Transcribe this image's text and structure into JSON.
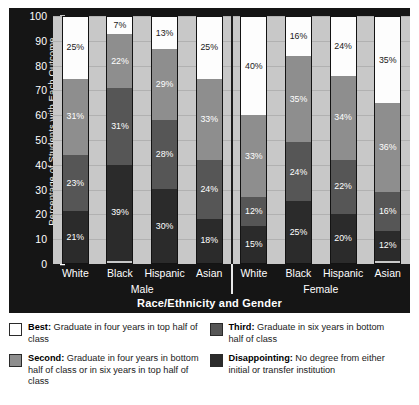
{
  "chart_data": {
    "type": "bar",
    "subtype": "stacked-bar-100",
    "title": "",
    "xlabel": "Race/Ethnicity and Gender",
    "ylabel": "Percentage of Students with Each Outcome",
    "ylim": [
      0,
      100
    ],
    "yticks": [
      0,
      10,
      20,
      30,
      40,
      50,
      60,
      70,
      80,
      90,
      100
    ],
    "ytick_labels": [
      "0",
      "10",
      "20",
      "30",
      "40",
      "50",
      "60",
      "70",
      "80",
      "90",
      "100"
    ],
    "grid": true,
    "legend_position": "below",
    "categories": [
      "White",
      "Black",
      "Hispanic",
      "Asian",
      "White",
      "Black",
      "Hispanic",
      "Asian"
    ],
    "groups": [
      {
        "label": "Male",
        "categories": [
          "White",
          "Black",
          "Hispanic",
          "Asian"
        ]
      },
      {
        "label": "Female",
        "categories": [
          "White",
          "Black",
          "Hispanic",
          "Asian"
        ]
      }
    ],
    "series": [
      {
        "name": "Best",
        "color": "#ffffff",
        "values": [
          25,
          7,
          13,
          25,
          40,
          16,
          24,
          35
        ]
      },
      {
        "name": "Second",
        "color": "#8e8e8e",
        "values": [
          31,
          22,
          29,
          33,
          33,
          35,
          34,
          36
        ]
      },
      {
        "name": "Third",
        "color": "#565656",
        "values": [
          23,
          31,
          28,
          24,
          12,
          24,
          22,
          16
        ]
      },
      {
        "name": "Disappointing",
        "color": "#2b2b2b",
        "values": [
          21,
          39,
          30,
          18,
          15,
          25,
          20,
          12
        ]
      }
    ],
    "bars": [
      {
        "group": "Male",
        "category": "White",
        "segments": [
          {
            "key": "Best",
            "value": 25,
            "label": "25%"
          },
          {
            "key": "Second",
            "value": 31,
            "label": "31%"
          },
          {
            "key": "Third",
            "value": 23,
            "label": "23%"
          },
          {
            "key": "Disappointing",
            "value": 21,
            "label": "21%"
          }
        ]
      },
      {
        "group": "Male",
        "category": "Black",
        "segments": [
          {
            "key": "Best",
            "value": 7,
            "label": "7%"
          },
          {
            "key": "Second",
            "value": 22,
            "label": "22%"
          },
          {
            "key": "Third",
            "value": 31,
            "label": "31%"
          },
          {
            "key": "Disappointing",
            "value": 39,
            "label": "39%"
          }
        ]
      },
      {
        "group": "Male",
        "category": "Hispanic",
        "segments": [
          {
            "key": "Best",
            "value": 13,
            "label": "13%"
          },
          {
            "key": "Second",
            "value": 29,
            "label": "29%"
          },
          {
            "key": "Third",
            "value": 28,
            "label": "28%"
          },
          {
            "key": "Disappointing",
            "value": 30,
            "label": "30%"
          }
        ]
      },
      {
        "group": "Male",
        "category": "Asian",
        "segments": [
          {
            "key": "Best",
            "value": 25,
            "label": "25%"
          },
          {
            "key": "Second",
            "value": 33,
            "label": "33%"
          },
          {
            "key": "Third",
            "value": 24,
            "label": "24%"
          },
          {
            "key": "Disappointing",
            "value": 18,
            "label": "18%"
          }
        ]
      },
      {
        "group": "Female",
        "category": "White",
        "segments": [
          {
            "key": "Best",
            "value": 40,
            "label": "40%"
          },
          {
            "key": "Second",
            "value": 33,
            "label": "33%"
          },
          {
            "key": "Third",
            "value": 12,
            "label": "12%"
          },
          {
            "key": "Disappointing",
            "value": 15,
            "label": "15%"
          }
        ]
      },
      {
        "group": "Female",
        "category": "Black",
        "segments": [
          {
            "key": "Best",
            "value": 16,
            "label": "16%"
          },
          {
            "key": "Second",
            "value": 35,
            "label": "35%"
          },
          {
            "key": "Third",
            "value": 24,
            "label": "24%"
          },
          {
            "key": "Disappointing",
            "value": 25,
            "label": "25%"
          }
        ]
      },
      {
        "group": "Female",
        "category": "Hispanic",
        "segments": [
          {
            "key": "Best",
            "value": 24,
            "label": "24%"
          },
          {
            "key": "Second",
            "value": 34,
            "label": "34%"
          },
          {
            "key": "Third",
            "value": 22,
            "label": "22%"
          },
          {
            "key": "Disappointing",
            "value": 20,
            "label": "20%"
          }
        ]
      },
      {
        "group": "Female",
        "category": "Asian",
        "segments": [
          {
            "key": "Best",
            "value": 35,
            "label": "35%"
          },
          {
            "key": "Second",
            "value": 36,
            "label": "36%"
          },
          {
            "key": "Third",
            "value": 16,
            "label": "16%"
          },
          {
            "key": "Disappointing",
            "value": 12,
            "label": "12%"
          }
        ]
      }
    ],
    "legend": [
      {
        "key": "Best:",
        "desc": " Graduate in four years in top half of class",
        "color": "#ffffff",
        "swatch": "best"
      },
      {
        "key": "Second:",
        "desc": " Graduate in four years in bottom half of class or in six years in top half of class",
        "color": "#8e8e8e",
        "swatch": "second"
      },
      {
        "key": "Third:",
        "desc": " Graduate in six years in bottom half of class",
        "color": "#565656",
        "swatch": "third"
      },
      {
        "key": "Disappointing:",
        "desc": " No degree from either initial or transfer institution",
        "color": "#2b2b2b",
        "swatch": "disapp"
      }
    ]
  }
}
